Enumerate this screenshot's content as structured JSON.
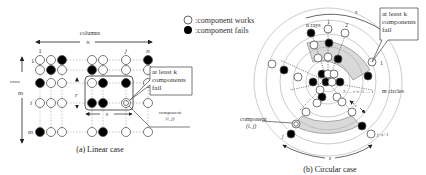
{
  "legend": {
    "works_label": ":component works",
    "fails_label": ":component fails"
  },
  "linear": {
    "caption": "(a) Linear case",
    "columns_label": "columns",
    "n_label": "n",
    "rows_label": "rows",
    "m_label": "m",
    "col_labels": [
      "1",
      "j",
      "n"
    ],
    "row_labels": [
      "1",
      "i",
      "m"
    ],
    "r_label": "r",
    "s_label": "s",
    "callout": [
      "at least k",
      "components",
      "fail"
    ],
    "component_label": [
      "component",
      "(i, j)"
    ]
  },
  "circular": {
    "caption": "(b) Circular case",
    "rays_label": "n rays",
    "ray_labels": [
      "1",
      "2"
    ],
    "s_top": "s",
    "callout": [
      "at least k",
      "components",
      "fail"
    ],
    "index_label": "2 … i−r+1 … i",
    "circles_label": "m circles",
    "r_label": "r",
    "component_label": [
      "component",
      "(i, j)"
    ],
    "j_label": "j",
    "j_s1_label": "j−s+1",
    "s_bottom": "s",
    "one_label": "1"
  },
  "colors": {
    "fail": "#000000",
    "work": "#ffffff",
    "stroke": "#555555",
    "shade": "#d9d9d9"
  }
}
